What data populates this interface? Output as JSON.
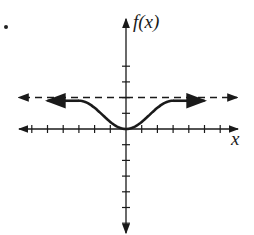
{
  "chart_data": {
    "type": "line",
    "title": "",
    "xlabel": "x",
    "ylabel": "f(x)",
    "xlim": [
      -7,
      7
    ],
    "ylim": [
      -7,
      5
    ],
    "ticks": {
      "x_step": 1,
      "y_step": 1,
      "labels_shown": false
    },
    "grid": false,
    "asymptote": {
      "type": "horizontal",
      "y": 2,
      "style": "dashed",
      "direction": "both arrows"
    },
    "series": [
      {
        "name": "f(x)",
        "style": "solid, thick",
        "x": [
          -5,
          -3,
          -2,
          -1,
          0,
          1,
          2,
          3,
          5
        ],
        "y": [
          1.8,
          1.8,
          1.4,
          0.6,
          0,
          0.6,
          1.4,
          1.8,
          1.8
        ],
        "end_behavior": "approaches y = 2 from below as x -> ±infinity (arrows on both ends)"
      }
    ],
    "key_points": [
      {
        "x": 0,
        "y": 0,
        "note": "minimum at origin"
      }
    ]
  },
  "labels": {
    "y_axis": "f(x)",
    "x_axis": "x"
  },
  "colors": {
    "ink": "#1a1a1a",
    "background": "#ffffff"
  }
}
